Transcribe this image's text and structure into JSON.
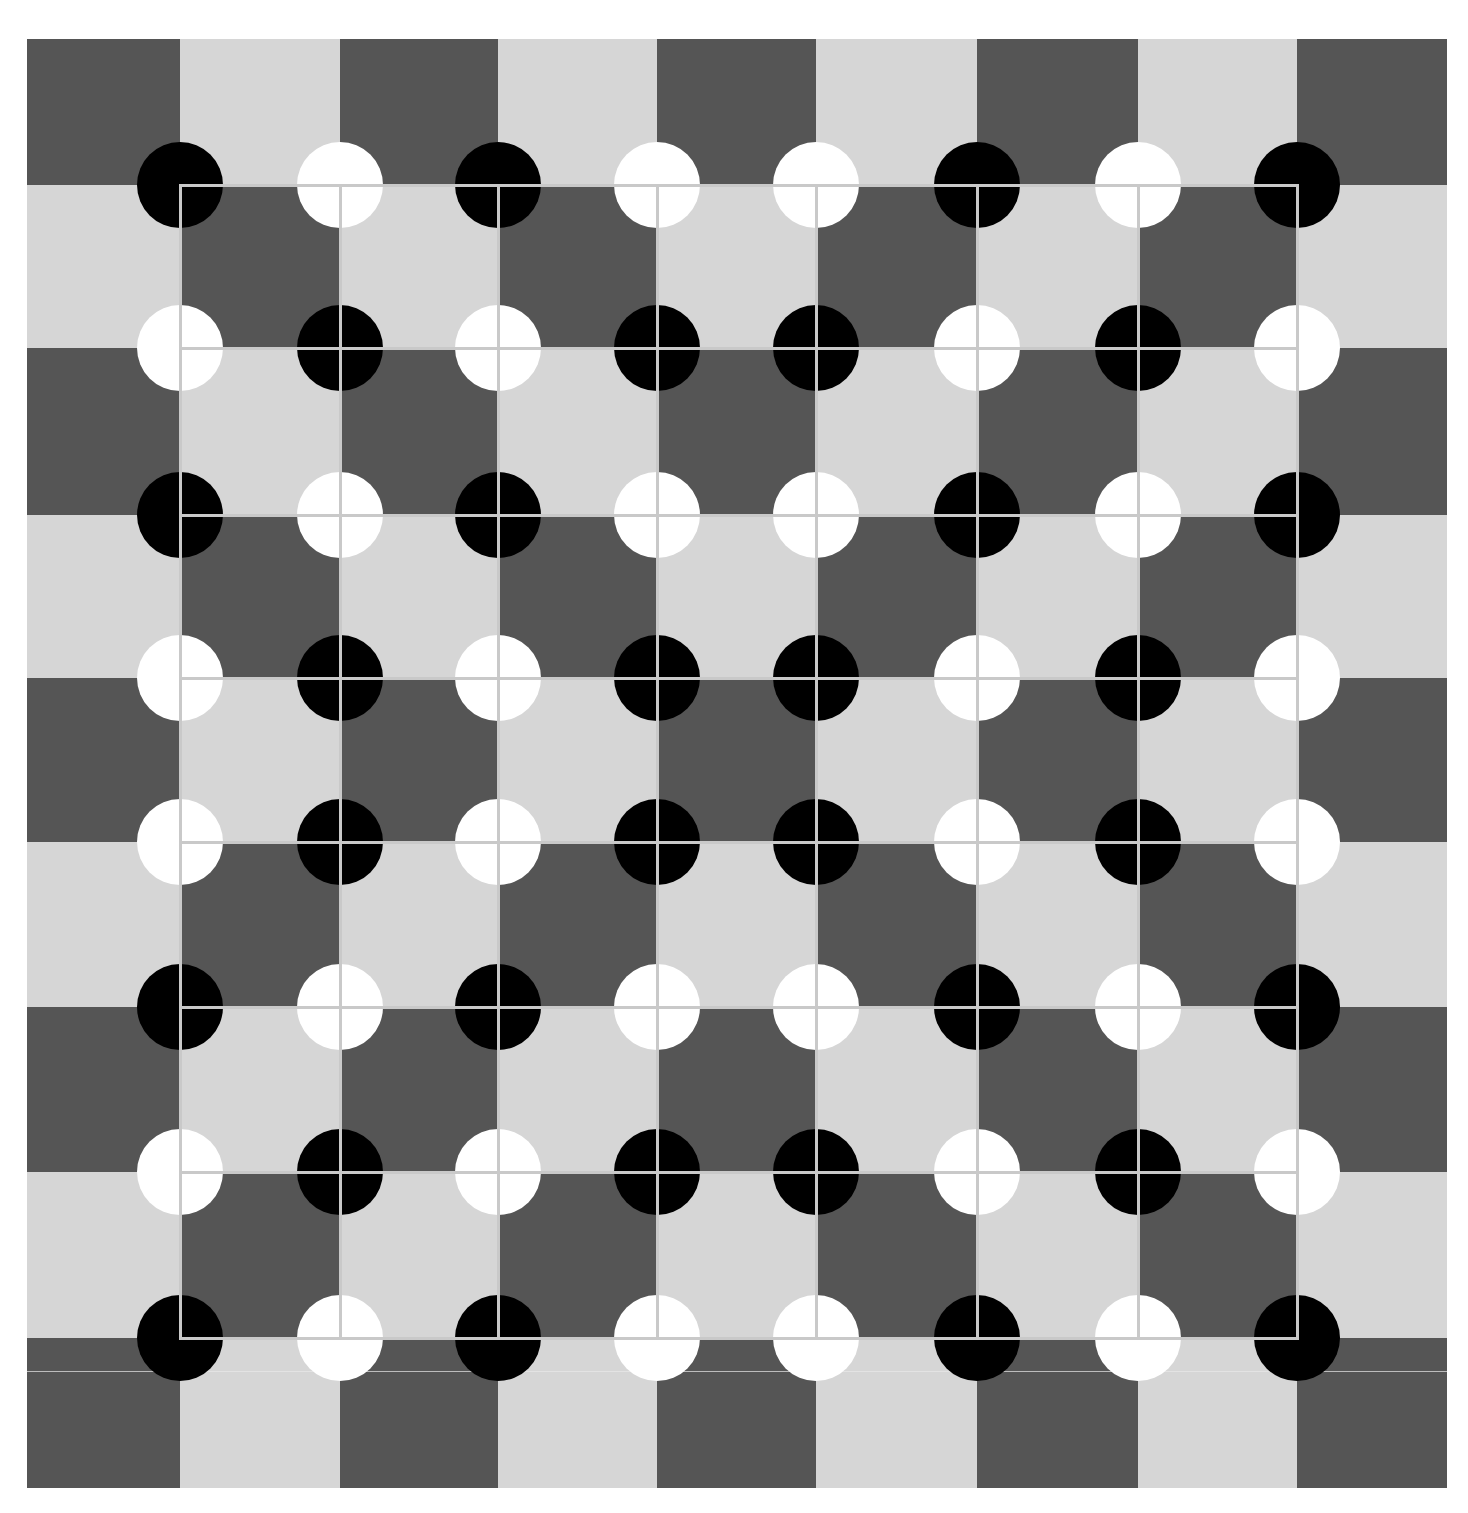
{
  "figure": {
    "background": "#ffffff",
    "colors": {
      "dark_square": "#555555",
      "light_square": "#d6d6d6",
      "grid_line": "#c9c9c9",
      "disc_black": "#000000",
      "disc_white": "#ffffff",
      "artifact_line": "#e8e8e8"
    },
    "column_edges": [
      27,
      180,
      340,
      498,
      657,
      816,
      977,
      1138,
      1297,
      1447
    ],
    "row_edges": [
      39,
      185,
      348,
      515,
      678,
      842,
      1007,
      1172,
      1338,
      1488
    ],
    "squares": [
      [
        "D",
        "L",
        "D",
        "L",
        "D",
        "L",
        "D",
        "L",
        "D"
      ],
      [
        "L",
        "D",
        "L",
        "D",
        "L",
        "D",
        "L",
        "D",
        "L"
      ],
      [
        "D",
        "L",
        "D",
        "L",
        "D",
        "L",
        "D",
        "L",
        "D"
      ],
      [
        "L",
        "D",
        "L",
        "D",
        "L",
        "D",
        "L",
        "D",
        "L"
      ],
      [
        "D",
        "L",
        "D",
        "L",
        "D",
        "L",
        "D",
        "L",
        "D"
      ],
      [
        "L",
        "D",
        "L",
        "D",
        "L",
        "D",
        "L",
        "D",
        "L"
      ],
      [
        "D",
        "L",
        "D",
        "L",
        "D",
        "L",
        "D",
        "L",
        "D"
      ],
      [
        "L",
        "D",
        "L",
        "D",
        "L",
        "D",
        "L",
        "D",
        "L"
      ],
      [
        "D",
        "L",
        "D",
        "L",
        "D",
        "L",
        "D",
        "L",
        "D"
      ]
    ],
    "grid": {
      "x_lines": [
        180,
        340,
        498,
        657,
        816,
        977,
        1138,
        1297
      ],
      "y_lines": [
        185,
        348,
        515,
        678,
        842,
        1007,
        1172,
        1338
      ],
      "line_width": 3
    },
    "disc_radius": 43,
    "discs": [
      [
        "B",
        "W",
        "B",
        "W",
        "W",
        "B",
        "W",
        "B"
      ],
      [
        "W",
        "B",
        "W",
        "B",
        "B",
        "W",
        "B",
        "W"
      ],
      [
        "B",
        "W",
        "B",
        "W",
        "W",
        "B",
        "W",
        "B"
      ],
      [
        "W",
        "B",
        "W",
        "B",
        "B",
        "W",
        "B",
        "W"
      ],
      [
        "W",
        "B",
        "W",
        "B",
        "B",
        "W",
        "B",
        "W"
      ],
      [
        "B",
        "W",
        "B",
        "W",
        "W",
        "B",
        "W",
        "B"
      ],
      [
        "W",
        "B",
        "W",
        "B",
        "B",
        "W",
        "B",
        "W"
      ],
      [
        "B",
        "W",
        "B",
        "W",
        "W",
        "B",
        "W",
        "B"
      ]
    ],
    "artifact_line_y": 1371
  }
}
